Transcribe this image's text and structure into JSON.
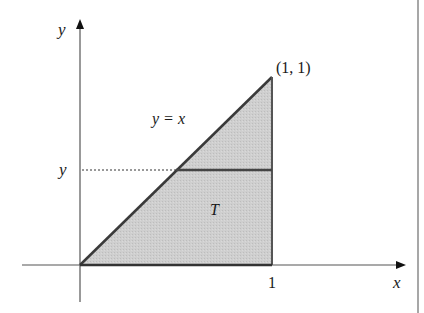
{
  "diagram": {
    "axes": {
      "y_label": "y",
      "x_label": "x"
    },
    "region": {
      "label": "T",
      "fill_color": "#c8c8c8",
      "edge_color": "#444444"
    },
    "curve_label": "y = x",
    "vertex_label": "(1, 1)",
    "y_level_label": "y",
    "x_tick_label": "1"
  }
}
